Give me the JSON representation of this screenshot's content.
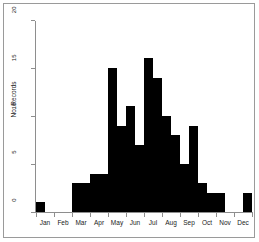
{
  "figure": {
    "background_color": "#ffffff",
    "frame_color": "#9a9a9a",
    "axis_color": "#8e8e8e",
    "bar_color": "#000000"
  },
  "chart_data": {
    "type": "bar",
    "title": "",
    "subtitle": "",
    "xlabel": "",
    "ylabel": "No. Records",
    "ylim": [
      0,
      20
    ],
    "xlim": [
      0,
      12
    ],
    "grid": false,
    "legend": null,
    "annotations": [],
    "y_ticks": [
      {
        "value": 20,
        "label": "20"
      },
      {
        "value": 15,
        "label": "15"
      },
      {
        "value": 10,
        "label": "10"
      },
      {
        "value": 5,
        "label": "5"
      },
      {
        "value": 0,
        "label": "0"
      }
    ],
    "categories": [
      "Jan",
      "Feb",
      "Mar",
      "Apr",
      "May",
      "Jun",
      "Jul",
      "Aug",
      "Sep",
      "Oct",
      "Nov",
      "Dec"
    ],
    "bin_width_months": 0.5,
    "note": "Histogram of record counts binned by half-month; each month spans two bins.",
    "bins": [
      {
        "label": "Jan early",
        "month": "Jan",
        "half": 1,
        "x0": 0.0,
        "x1": 0.5,
        "value": 1
      },
      {
        "label": "Jan late",
        "month": "Jan",
        "half": 2,
        "x0": 0.5,
        "x1": 1.0,
        "value": 0
      },
      {
        "label": "Feb early",
        "month": "Feb",
        "half": 1,
        "x0": 1.0,
        "x1": 1.5,
        "value": 0
      },
      {
        "label": "Feb late",
        "month": "Feb",
        "half": 2,
        "x0": 1.5,
        "x1": 2.0,
        "value": 0
      },
      {
        "label": "Mar early",
        "month": "Mar",
        "half": 1,
        "x0": 2.0,
        "x1": 2.5,
        "value": 3
      },
      {
        "label": "Mar late",
        "month": "Mar",
        "half": 2,
        "x0": 2.5,
        "x1": 3.0,
        "value": 3
      },
      {
        "label": "Apr early",
        "month": "Apr",
        "half": 1,
        "x0": 3.0,
        "x1": 3.5,
        "value": 4
      },
      {
        "label": "Apr late",
        "month": "Apr",
        "half": 2,
        "x0": 3.5,
        "x1": 4.0,
        "value": 4
      },
      {
        "label": "May early",
        "month": "May",
        "half": 1,
        "x0": 4.0,
        "x1": 4.5,
        "value": 15
      },
      {
        "label": "May late",
        "month": "May",
        "half": 2,
        "x0": 4.5,
        "x1": 5.0,
        "value": 9
      },
      {
        "label": "Jun early",
        "month": "Jun",
        "half": 1,
        "x0": 5.0,
        "x1": 5.5,
        "value": 11
      },
      {
        "label": "Jun late",
        "month": "Jun",
        "half": 2,
        "x0": 5.5,
        "x1": 6.0,
        "value": 7
      },
      {
        "label": "Jul early",
        "month": "Jul",
        "half": 1,
        "x0": 6.0,
        "x1": 6.5,
        "value": 16
      },
      {
        "label": "Jul late",
        "month": "Jul",
        "half": 2,
        "x0": 6.5,
        "x1": 7.0,
        "value": 14
      },
      {
        "label": "Aug early",
        "month": "Aug",
        "half": 1,
        "x0": 7.0,
        "x1": 7.5,
        "value": 10
      },
      {
        "label": "Aug late",
        "month": "Aug",
        "half": 2,
        "x0": 7.5,
        "x1": 8.0,
        "value": 8
      },
      {
        "label": "Sep early",
        "month": "Sep",
        "half": 1,
        "x0": 8.0,
        "x1": 8.5,
        "value": 5
      },
      {
        "label": "Sep late",
        "month": "Sep",
        "half": 2,
        "x0": 8.5,
        "x1": 9.0,
        "value": 9
      },
      {
        "label": "Oct early",
        "month": "Oct",
        "half": 1,
        "x0": 9.0,
        "x1": 9.5,
        "value": 3
      },
      {
        "label": "Oct late",
        "month": "Oct",
        "half": 2,
        "x0": 9.5,
        "x1": 10.0,
        "value": 2
      },
      {
        "label": "Nov early",
        "month": "Nov",
        "half": 1,
        "x0": 10.0,
        "x1": 10.5,
        "value": 2
      },
      {
        "label": "Nov late",
        "month": "Nov",
        "half": 2,
        "x0": 10.5,
        "x1": 11.0,
        "value": 0
      },
      {
        "label": "Dec early",
        "month": "Dec",
        "half": 1,
        "x0": 11.0,
        "x1": 11.5,
        "value": 0
      },
      {
        "label": "Dec late",
        "month": "Dec",
        "half": 2,
        "x0": 11.5,
        "x1": 12.0,
        "value": 2
      }
    ],
    "monthly_totals": {
      "Jan": 1,
      "Feb": 0,
      "Mar": 6,
      "Apr": 8,
      "May": 24,
      "Jun": 18,
      "Jul": 30,
      "Aug": 18,
      "Sep": 14,
      "Oct": 5,
      "Nov": 2,
      "Dec": 2
    }
  }
}
